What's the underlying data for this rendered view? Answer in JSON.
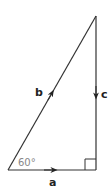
{
  "diagram": {
    "type": "right-triangle-vectors",
    "vectors": [
      {
        "label": "a",
        "direction": "right",
        "side": "bottom"
      },
      {
        "label": "b",
        "direction": "up-right",
        "side": "hypotenuse"
      },
      {
        "label": "c",
        "direction": "down",
        "side": "right"
      }
    ],
    "angle_label": "60°",
    "right_angle_marker": true,
    "colors": {
      "line": "#333333",
      "angle_text": "#888888"
    }
  }
}
